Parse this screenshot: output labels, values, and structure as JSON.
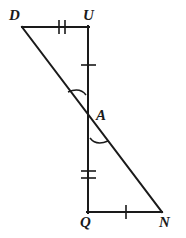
{
  "figure": {
    "width": 186,
    "height": 238,
    "background_color": "#ffffff",
    "stroke_color": "#1a1a1a",
    "stroke_width": 2
  },
  "labels": {
    "D": "D",
    "U": "U",
    "A": "A",
    "Q": "Q",
    "N": "N"
  },
  "points": {
    "D": {
      "x": 22,
      "y": 27
    },
    "U": {
      "x": 88,
      "y": 27
    },
    "A": {
      "x": 88,
      "y": 116
    },
    "Q": {
      "x": 88,
      "y": 212
    },
    "N": {
      "x": 162,
      "y": 212
    }
  },
  "segments": [
    {
      "name": "DU",
      "from": "D",
      "to": "U",
      "ticks": 2
    },
    {
      "name": "UA",
      "from": "U",
      "to": "A",
      "ticks": 1
    },
    {
      "name": "AQ",
      "from": "A",
      "to": "Q",
      "ticks": 2
    },
    {
      "name": "QN",
      "from": "Q",
      "to": "N",
      "ticks": 1
    },
    {
      "name": "DN",
      "from": "D",
      "to": "N",
      "ticks": 0
    }
  ],
  "tick_marks": [
    {
      "name": "tick-DU",
      "segment": "DU",
      "count": 2,
      "x": 62,
      "y": 27,
      "orientation": "vertical"
    },
    {
      "name": "tick-UA",
      "segment": "UA",
      "count": 1,
      "x": 88,
      "y": 65,
      "orientation": "horizontal"
    },
    {
      "name": "tick-AQ",
      "segment": "AQ",
      "count": 2,
      "x": 88,
      "y": 175,
      "orientation": "horizontal"
    },
    {
      "name": "tick-QN",
      "segment": "QN",
      "count": 1,
      "x": 126,
      "y": 212,
      "orientation": "vertical"
    }
  ],
  "angle_arcs": [
    {
      "name": "angle-arc-DAU",
      "vertex": "A",
      "position": "upper-left",
      "cx": 88,
      "cy": 116,
      "radius": 26
    },
    {
      "name": "angle-arc-NAQ",
      "vertex": "A",
      "position": "lower-right",
      "cx": 88,
      "cy": 116,
      "radius": 26
    }
  ],
  "triangles": [
    {
      "name": "triangle-DUA",
      "vertices": [
        "D",
        "U",
        "A"
      ]
    },
    {
      "name": "triangle-NQA",
      "vertices": [
        "N",
        "Q",
        "A"
      ]
    }
  ]
}
